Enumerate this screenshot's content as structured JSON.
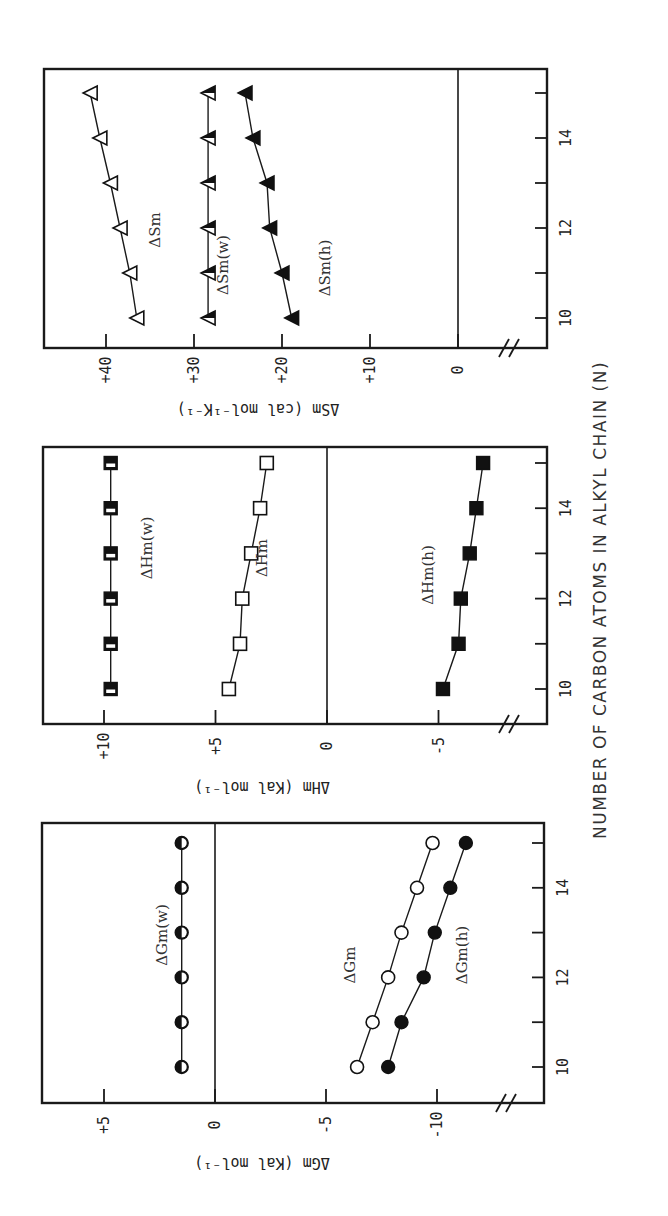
{
  "chart_data": [
    {
      "type": "line",
      "panel": "left",
      "title": "",
      "xlabel": "NUMBER OF CARBON ATOMS IN ALKYL CHAIN (N)",
      "ylabel": "ΔGm (Kal mol⁻¹)",
      "x": [
        10,
        11,
        12,
        13,
        14,
        15
      ],
      "x_ticks": [
        10,
        11,
        12,
        13,
        14,
        15
      ],
      "x_tick_labels": [
        "10",
        "12",
        "14"
      ],
      "ylim": [
        -12.5,
        7
      ],
      "y_ticks": [
        5,
        0,
        -5,
        -10
      ],
      "y_tick_labels": [
        "+5",
        "0",
        "-5",
        "-10"
      ],
      "zero_line": true,
      "axis_break": true,
      "series": [
        {
          "name": "ΔGm(w)",
          "marker": "half-filled-circle",
          "values": [
            1.5,
            1.5,
            1.5,
            1.5,
            1.5,
            1.5
          ]
        },
        {
          "name": "ΔGm",
          "marker": "open-circle",
          "values": [
            -6.4,
            -7.1,
            -7.8,
            -8.4,
            -9.1,
            -9.8
          ]
        },
        {
          "name": "ΔGm(h)",
          "marker": "filled-circle",
          "values": [
            -7.8,
            -8.4,
            -9.4,
            -9.9,
            -10.6,
            -11.3
          ]
        }
      ]
    },
    {
      "type": "line",
      "panel": "middle",
      "title": "",
      "xlabel": "NUMBER OF CARBON ATOMS IN ALKYL CHAIN (N)",
      "ylabel": "ΔHm (Kal mol⁻¹)",
      "x": [
        10,
        11,
        12,
        13,
        14,
        15
      ],
      "x_ticks": [
        10,
        11,
        12,
        13,
        14,
        15
      ],
      "x_tick_labels": [
        "10",
        "12",
        "14"
      ],
      "ylim": [
        -9.7,
        12.9
      ],
      "y_ticks": [
        10,
        5,
        0,
        -5
      ],
      "y_tick_labels": [
        "+10",
        "+5",
        "0",
        "-5"
      ],
      "zero_line": true,
      "axis_break": true,
      "series": [
        {
          "name": "ΔHm(w)",
          "marker": "half-filled-square",
          "values": [
            9.7,
            9.7,
            9.7,
            9.7,
            9.7,
            9.7
          ]
        },
        {
          "name": "ΔHm",
          "marker": "open-square",
          "values": [
            4.4,
            3.9,
            3.8,
            3.4,
            3.0,
            2.7
          ]
        },
        {
          "name": "ΔHm(h)",
          "marker": "filled-square",
          "values": [
            -5.2,
            -5.9,
            -6.0,
            -6.4,
            -6.7,
            -7.0
          ]
        }
      ]
    },
    {
      "type": "line",
      "panel": "right",
      "title": "",
      "xlabel": "NUMBER OF CARBON ATOMS IN ALKYL CHAIN (N)",
      "ylabel": "ΔSm (cal mol⁻¹K⁻¹)",
      "x": [
        10,
        11,
        12,
        13,
        14,
        15
      ],
      "x_ticks": [
        10,
        11,
        12,
        13,
        14,
        15
      ],
      "x_tick_labels": [
        "10",
        "12",
        "14"
      ],
      "ylim": [
        -10,
        47
      ],
      "y_ticks": [
        40,
        30,
        20,
        10,
        0
      ],
      "y_tick_labels": [
        "+40",
        "+30",
        "+20",
        "+10",
        "0"
      ],
      "zero_line": true,
      "axis_break": true,
      "series": [
        {
          "name": "ΔSm",
          "marker": "open-triangle",
          "values": [
            36.5,
            37.3,
            38.4,
            39.5,
            40.7,
            41.8
          ]
        },
        {
          "name": "ΔSm(w)",
          "marker": "half-filled-triangle",
          "values": [
            28.4,
            28.4,
            28.4,
            28.4,
            28.4,
            28.4
          ]
        },
        {
          "name": "ΔSm(h)",
          "marker": "filled-triangle",
          "values": [
            18.9,
            20.0,
            21.4,
            21.7,
            23.3,
            24.2
          ]
        }
      ]
    }
  ],
  "figure": {
    "shared_xlabel": "NUMBER OF CARBON ATOMS IN ALKYL CHAIN (N)",
    "orientation": "rotated 90° counter-clockwise"
  }
}
